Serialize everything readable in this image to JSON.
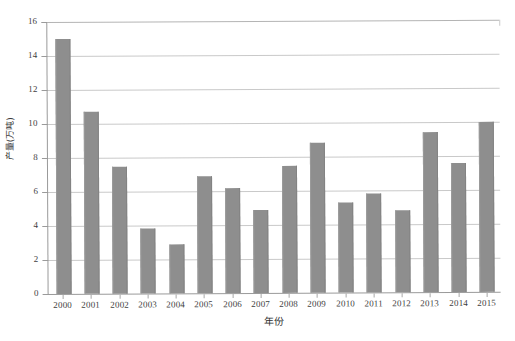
{
  "chart_data": {
    "type": "bar",
    "title": "",
    "xlabel": "年份",
    "ylabel": "产量(万吨)",
    "categories": [
      "2000",
      "2001",
      "2002",
      "2003",
      "2004",
      "2005",
      "2006",
      "2007",
      "2008",
      "2009",
      "2010",
      "2011",
      "2012",
      "2013",
      "2014",
      "2015"
    ],
    "values": [
      15.0,
      10.7,
      7.5,
      3.8,
      2.9,
      6.9,
      6.2,
      4.9,
      7.5,
      8.8,
      5.3,
      5.8,
      4.8,
      9.4,
      7.6,
      10.0
    ],
    "series": [
      {
        "name": "产量(万吨)",
        "values": [
          15.0,
          10.7,
          7.5,
          3.8,
          2.9,
          6.9,
          6.2,
          4.9,
          7.5,
          8.8,
          5.3,
          5.8,
          4.8,
          9.4,
          7.6,
          10.0
        ]
      }
    ],
    "ylim": [
      0,
      16
    ],
    "ytick_step": 2,
    "ytick_labels": [
      "0",
      "2",
      "4",
      "6",
      "8",
      "10",
      "12",
      "14",
      "16"
    ],
    "xtick_labels": [
      "2000",
      "2001",
      "2002",
      "2003",
      "2004",
      "2005",
      "2006",
      "2007",
      "2008",
      "2009",
      "2010",
      "2011",
      "2012",
      "2013",
      "2014",
      "2015"
    ],
    "grid": "horizontal",
    "legend": "none",
    "bar_color": "#8e8e8e",
    "gridline_color": "#c9c9c9",
    "axis_color": "#9a9a9a",
    "annotations": []
  },
  "axes": {
    "y_title": "产量(万吨)",
    "x_title": "年份"
  }
}
